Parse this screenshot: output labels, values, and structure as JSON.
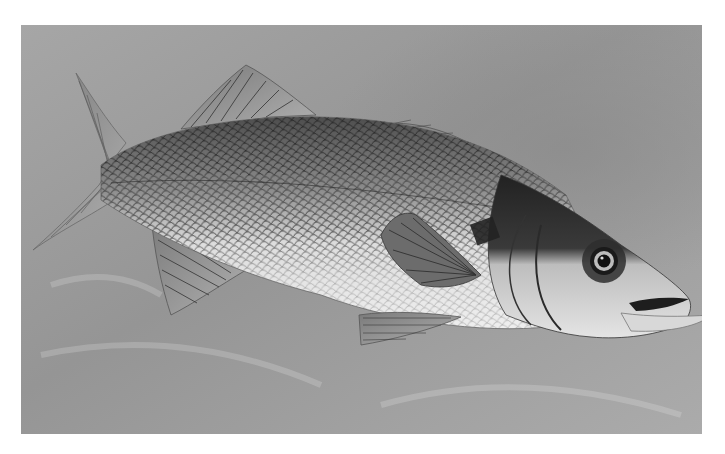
{
  "image": {
    "subject": "European sea bass",
    "style": "grayscale painted illustration",
    "alt": "Painted illustration of a sea bass swimming to the right on a mottled gray background"
  },
  "colors": {
    "page_background": "#ffffff",
    "canvas_background": "#9a9a9a",
    "canvas_light": "#b4b4b4",
    "body_dark": "#4a4a4a",
    "body_light": "#e6e6e6",
    "head_dark": "#2a2a2a",
    "eye": "#111111"
  }
}
